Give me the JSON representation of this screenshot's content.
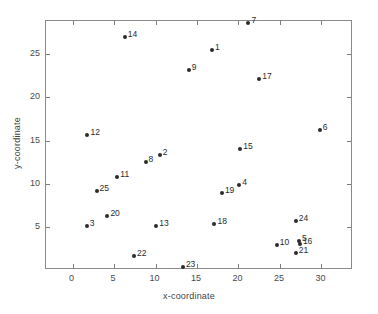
{
  "chart_data": {
    "type": "scatter",
    "title": "",
    "xlabel": "x-coordinate",
    "ylabel": "y-coordinate",
    "xlim": [
      -3.2,
      33.8
    ],
    "ylim": [
      0.1,
      28.8
    ],
    "xticks": [
      0,
      5,
      10,
      15,
      20,
      25,
      30
    ],
    "xticklabels": [
      "0",
      "5",
      "10",
      "15",
      "20",
      "25",
      "30"
    ],
    "yticks": [
      5,
      10,
      15,
      20,
      25
    ],
    "yticklabels": [
      "5",
      "10",
      "15",
      "20",
      "25"
    ],
    "grid": false,
    "legend": false,
    "marker": "filled-circle",
    "marker_color": "#2b2b2b",
    "points": [
      {
        "label": "1",
        "x": 16.8,
        "y": 25.5
      },
      {
        "label": "2",
        "x": 10.5,
        "y": 13.4
      },
      {
        "label": "3",
        "x": 1.7,
        "y": 5.2
      },
      {
        "label": "4",
        "x": 20.1,
        "y": 9.95
      },
      {
        "label": "5",
        "x": 27.3,
        "y": 3.4
      },
      {
        "label": "6",
        "x": 29.8,
        "y": 16.2
      },
      {
        "label": "7",
        "x": 21.2,
        "y": 28.6
      },
      {
        "label": "8",
        "x": 8.8,
        "y": 12.5
      },
      {
        "label": "9",
        "x": 14.0,
        "y": 23.1
      },
      {
        "label": "10",
        "x": 24.6,
        "y": 3.0
      },
      {
        "label": "11",
        "x": 5.4,
        "y": 10.8
      },
      {
        "label": "12",
        "x": 1.8,
        "y": 15.7
      },
      {
        "label": "13",
        "x": 10.1,
        "y": 5.2
      },
      {
        "label": "14",
        "x": 6.3,
        "y": 27.0
      },
      {
        "label": "15",
        "x": 20.2,
        "y": 14.1
      },
      {
        "label": "16",
        "x": 27.4,
        "y": 3.1
      },
      {
        "label": "17",
        "x": 22.5,
        "y": 22.1
      },
      {
        "label": "18",
        "x": 17.1,
        "y": 5.4
      },
      {
        "label": "19",
        "x": 18.0,
        "y": 9.0
      },
      {
        "label": "20",
        "x": 4.2,
        "y": 6.3
      },
      {
        "label": "21",
        "x": 26.9,
        "y": 2.1
      },
      {
        "label": "22",
        "x": 7.4,
        "y": 1.7
      },
      {
        "label": "23",
        "x": 13.3,
        "y": 0.4
      },
      {
        "label": "24",
        "x": 26.9,
        "y": 5.8
      },
      {
        "label": "25",
        "x": 2.9,
        "y": 9.2
      }
    ]
  }
}
